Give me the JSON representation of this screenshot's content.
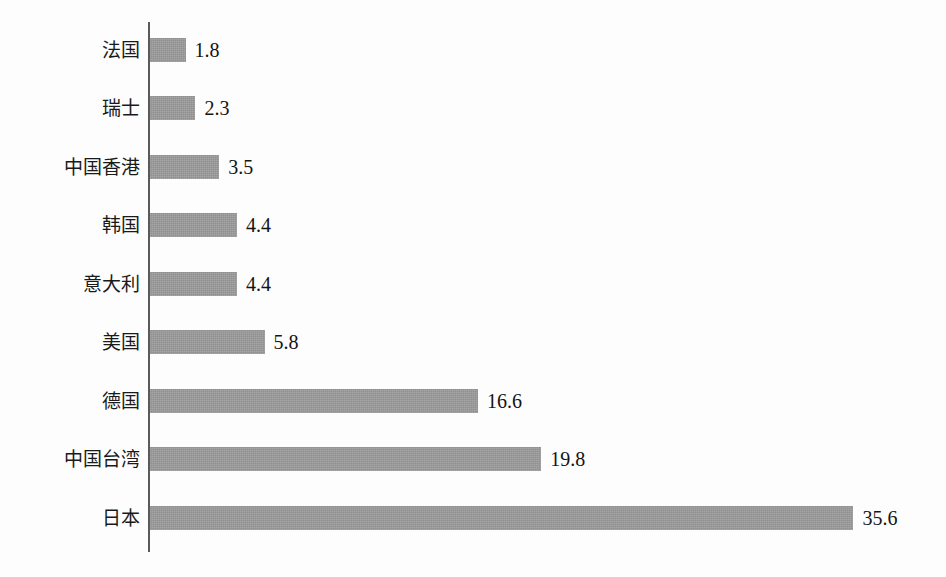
{
  "chart_data": {
    "type": "bar",
    "orientation": "horizontal",
    "title": "",
    "subtitle": "",
    "xlabel": "",
    "ylabel": "",
    "grid": false,
    "legend": null,
    "axis": {
      "value_axis_min": 0,
      "value_axis_max": 35.6,
      "ticks_visible": false,
      "category_axis_line": true
    },
    "categories": [
      "法国",
      "瑞士",
      "中国香港",
      "韩国",
      "意大利",
      "美国",
      "德国",
      "中国台湾",
      "日本"
    ],
    "values": [
      1.8,
      2.3,
      3.5,
      4.4,
      4.4,
      5.8,
      16.6,
      19.8,
      35.6
    ],
    "value_labels": [
      "1.8",
      "2.3",
      "3.5",
      "4.4",
      "4.4",
      "5.8",
      "16.6",
      "19.8",
      "35.6"
    ],
    "series": [
      {
        "name": "",
        "values": [
          1.8,
          2.3,
          3.5,
          4.4,
          4.4,
          5.8,
          16.6,
          19.8,
          35.6
        ]
      }
    ],
    "bars": [
      {
        "category": "法国",
        "value": 1.8,
        "label": "1.8"
      },
      {
        "category": "瑞士",
        "value": 2.3,
        "label": "2.3"
      },
      {
        "category": "中国香港",
        "value": 3.5,
        "label": "3.5"
      },
      {
        "category": "韩国",
        "value": 4.4,
        "label": "4.4"
      },
      {
        "category": "意大利",
        "value": 4.4,
        "label": "4.4"
      },
      {
        "category": "美国",
        "value": 5.8,
        "label": "5.8"
      },
      {
        "category": "德国",
        "value": 16.6,
        "label": "16.6"
      },
      {
        "category": "中国台湾",
        "value": 19.8,
        "label": "19.8"
      },
      {
        "category": "日本",
        "value": 35.6,
        "label": "35.6"
      }
    ]
  },
  "style": {
    "bar_color": "#9a9a9a",
    "axis_color": "#5a5a5a",
    "text_color": "#1a1a1a",
    "background_color": "#fdfdfd"
  }
}
